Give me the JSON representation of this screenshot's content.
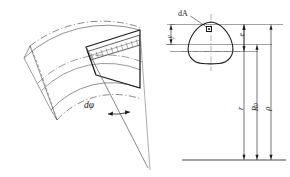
{
  "figure": {
    "stroke_color": "#1a1a1a",
    "thin_color": "#555555",
    "background": "#ffffff"
  },
  "left_diagram": {
    "name": "curved-beam-segment",
    "angle_label": "dφ",
    "description": "Curved beam arc with highlighted differential segment and hatched strip",
    "hatched_strip": true,
    "dashed_outline": true,
    "radial_lines": 2,
    "apex_converges": true
  },
  "right_diagram": {
    "name": "cross-section-dimensions",
    "section_shape": "rounded-triangular-egg",
    "area_element_label": "dA",
    "dimensions": [
      {
        "symbol": "y",
        "name": "distance-y",
        "orientation": "vertical-short"
      },
      {
        "symbol": "e",
        "name": "eccentricity-e",
        "orientation": "vertical-short"
      },
      {
        "symbol": "r",
        "name": "radius-r",
        "orientation": "vertical-long"
      },
      {
        "symbol": "R",
        "sub": "0",
        "name": "radius-R0",
        "orientation": "vertical-long"
      },
      {
        "symbol": "ρ",
        "name": "radius-rho",
        "orientation": "vertical-long"
      }
    ],
    "reference_lines": 4,
    "baseline": "center-of-curvature-axis"
  }
}
